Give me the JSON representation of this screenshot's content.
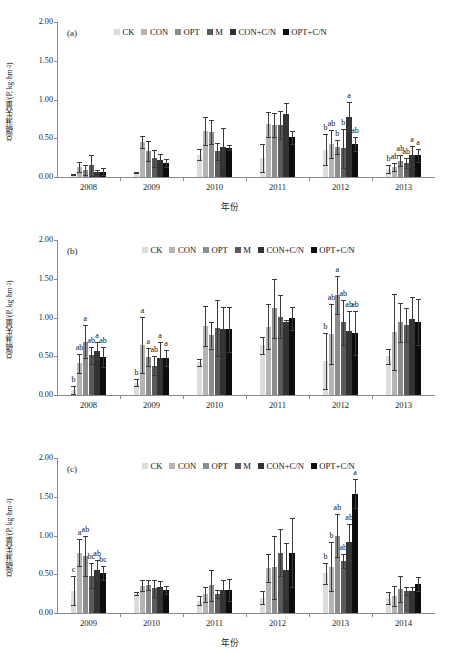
{
  "figure": {
    "axis_title_x": "年份",
    "axis_title_y_main": "总磷淋失量/(P, kg·hm",
    "axis_title_y_sup": "-2",
    "axis_title_y_tail": ")",
    "ytick_labels": [
      "0.00",
      "0.50",
      "1.00",
      "1.50",
      "2.00"
    ],
    "series_names": [
      "CK",
      "CON",
      "OPT",
      "M",
      "CON+C/N",
      "OPT+C/N"
    ],
    "series_colors": [
      "#dcdcdc",
      "#b4b4b4",
      "#8c8c8c",
      "#5a5a5a",
      "#333333",
      "#0d0d0d"
    ]
  },
  "panels": [
    {
      "tag": "(a)"
    },
    {
      "tag": "(b)"
    },
    {
      "tag": "(c)"
    }
  ],
  "chart_data": [
    {
      "type": "bar",
      "panel": "(a)",
      "title": "",
      "xlabel": "年份",
      "ylabel": "总磷淋失量/(P, kg·hm-2)",
      "ylim": [
        0,
        2.0
      ],
      "yticks": [
        0.0,
        0.5,
        1.0,
        1.5,
        2.0
      ],
      "grid": false,
      "legend_position": "top-center",
      "categories": [
        "2008",
        "2009",
        "2010",
        "2011",
        "2012",
        "2013"
      ],
      "series": [
        {
          "name": "CK",
          "values": [
            0.03,
            0.06,
            0.29,
            0.24,
            0.35,
            0.1
          ],
          "errors": [
            0.01,
            0.01,
            0.07,
            0.18,
            0.2,
            0.05
          ],
          "letters": [
            "",
            "",
            "",
            "",
            "b",
            "b"
          ]
        },
        {
          "name": "CON",
          "values": [
            0.13,
            0.45,
            0.59,
            0.68,
            0.43,
            0.13
          ],
          "errors": [
            0.06,
            0.08,
            0.18,
            0.16,
            0.18,
            0.05
          ],
          "letters": [
            "",
            "",
            "",
            "",
            "ab",
            "ab"
          ]
        },
        {
          "name": "OPT",
          "values": [
            0.09,
            0.34,
            0.58,
            0.67,
            0.39,
            0.21
          ],
          "errors": [
            0.07,
            0.13,
            0.15,
            0.16,
            0.09,
            0.07
          ],
          "letters": [
            "",
            "",
            "",
            "",
            "b",
            "ab"
          ]
        },
        {
          "name": "M",
          "values": [
            0.15,
            0.24,
            0.33,
            0.67,
            0.37,
            0.18
          ],
          "errors": [
            0.14,
            0.11,
            0.11,
            0.18,
            0.25,
            0.06
          ],
          "letters": [
            "",
            "",
            "",
            "",
            "b",
            "ab"
          ]
        },
        {
          "name": "CON+C/N",
          "values": [
            0.06,
            0.22,
            0.39,
            0.81,
            0.78,
            0.28
          ],
          "errors": [
            0.03,
            0.08,
            0.24,
            0.14,
            0.19,
            0.12
          ],
          "letters": [
            "",
            "",
            "",
            "",
            "a",
            "a"
          ]
        },
        {
          "name": "OPT+C/N",
          "values": [
            0.07,
            0.18,
            0.38,
            0.51,
            0.42,
            0.28
          ],
          "errors": [
            0.04,
            0.05,
            0.03,
            0.09,
            0.09,
            0.08
          ],
          "letters": [
            "",
            "",
            "",
            "",
            "ab",
            "a"
          ]
        }
      ]
    },
    {
      "type": "bar",
      "panel": "(b)",
      "title": "",
      "xlabel": "年份",
      "ylabel": "总磷淋失量/(P, kg·hm-2)",
      "ylim": [
        0,
        2.0
      ],
      "yticks": [
        0.0,
        0.5,
        1.0,
        1.5,
        2.0
      ],
      "grid": false,
      "legend_position": "top-center",
      "categories": [
        "2008",
        "2009",
        "2010",
        "2011",
        "2012",
        "2013"
      ],
      "series": [
        {
          "name": "CK",
          "values": [
            0.06,
            0.16,
            0.42,
            0.64,
            0.44,
            0.5
          ],
          "errors": [
            0.05,
            0.05,
            0.05,
            0.11,
            0.36,
            0.1
          ],
          "letters": [
            "b",
            "b",
            "",
            "",
            "b",
            ""
          ]
        },
        {
          "name": "CON",
          "values": [
            0.41,
            0.65,
            0.89,
            0.88,
            0.79,
            0.81
          ],
          "errors": [
            0.12,
            0.36,
            0.26,
            0.29,
            0.39,
            0.49
          ],
          "letters": [
            "ab",
            "a",
            "",
            "",
            "ab",
            ""
          ]
        },
        {
          "name": "OPT",
          "values": [
            0.69,
            0.49,
            0.77,
            1.12,
            1.29,
            0.94
          ],
          "errors": [
            0.21,
            0.12,
            0.17,
            0.38,
            0.24,
            0.25
          ],
          "letters": [
            "a",
            "a",
            "",
            "",
            "a",
            ""
          ]
        },
        {
          "name": "M",
          "values": [
            0.51,
            0.38,
            0.86,
            1.01,
            0.94,
            0.9
          ],
          "errors": [
            0.11,
            0.12,
            0.36,
            0.28,
            0.29,
            0.22
          ],
          "letters": [
            "ab",
            "ab",
            "",
            "",
            "ab",
            ""
          ]
        },
        {
          "name": "CON+C/N",
          "values": [
            0.57,
            0.48,
            0.85,
            0.94,
            0.82,
            0.98
          ],
          "errors": [
            0.11,
            0.21,
            0.29,
            0.03,
            0.26,
            0.28
          ],
          "letters": [
            "a",
            "a",
            "",
            "",
            "ab",
            ""
          ]
        },
        {
          "name": "OPT+C/N",
          "values": [
            0.49,
            0.48,
            0.85,
            0.99,
            0.8,
            0.94
          ],
          "errors": [
            0.13,
            0.1,
            0.29,
            0.15,
            0.29,
            0.3
          ],
          "letters": [
            "ab",
            "a",
            "",
            "",
            "ab",
            ""
          ]
        }
      ]
    },
    {
      "type": "bar",
      "panel": "(c)",
      "title": "",
      "xlabel": "年份",
      "ylabel": "总磷淋失量/(P, kg·hm-2)",
      "ylim": [
        0,
        2.0
      ],
      "yticks": [
        0.0,
        0.5,
        1.0,
        1.5,
        2.0
      ],
      "grid": false,
      "legend_position": "top-center",
      "categories": [
        "2009",
        "2010",
        "2011",
        "2012",
        "2013",
        "2014"
      ],
      "series": [
        {
          "name": "CK",
          "values": [
            0.29,
            0.25,
            0.16,
            0.2,
            0.51,
            0.19
          ],
          "errors": [
            0.19,
            0.02,
            0.06,
            0.09,
            0.14,
            0.08
          ],
          "letters": [
            "c",
            "",
            "",
            "",
            "b",
            ""
          ]
        },
        {
          "name": "CON",
          "values": [
            0.78,
            0.35,
            0.24,
            0.58,
            0.6,
            0.22
          ],
          "errors": [
            0.17,
            0.07,
            0.1,
            0.18,
            0.31,
            0.13
          ],
          "letters": [
            "a",
            "",
            "",
            "",
            "b",
            ""
          ]
        },
        {
          "name": "OPT",
          "values": [
            0.74,
            0.36,
            0.36,
            0.59,
            1.0,
            0.31
          ],
          "errors": [
            0.26,
            0.06,
            0.2,
            0.41,
            0.28,
            0.17
          ],
          "letters": [
            "ab",
            "",
            "",
            "",
            "ab",
            ""
          ]
        },
        {
          "name": "M",
          "values": [
            0.48,
            0.32,
            0.25,
            0.78,
            0.67,
            0.28
          ],
          "errors": [
            0.16,
            0.11,
            0.05,
            0.3,
            0.09,
            0.05
          ],
          "letters": [
            "bc",
            "",
            "",
            "",
            "ab",
            ""
          ]
        },
        {
          "name": "CON+C/N",
          "values": [
            0.56,
            0.34,
            0.3,
            0.56,
            0.91,
            0.29
          ],
          "errors": [
            0.12,
            0.07,
            0.13,
            0.34,
            0.24,
            0.05
          ],
          "letters": [
            "ab",
            "",
            "",
            "",
            "ab",
            ""
          ]
        },
        {
          "name": "OPT+C/N",
          "values": [
            0.52,
            0.3,
            0.3,
            0.78,
            1.54,
            0.38
          ],
          "errors": [
            0.09,
            0.05,
            0.14,
            0.45,
            0.19,
            0.09
          ],
          "letters": [
            "bc",
            "",
            "",
            "",
            "a",
            ""
          ]
        }
      ]
    }
  ]
}
